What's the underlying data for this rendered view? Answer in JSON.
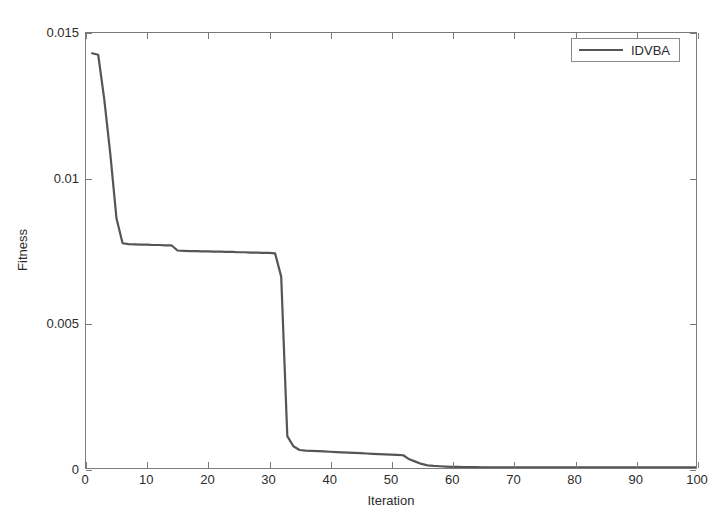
{
  "figure": {
    "background": "#ffffff",
    "axes_color": "#7a7a7a",
    "text_color": "#2b2b2b"
  },
  "axis": {
    "xlabel": "Iteration",
    "ylabel": "Fitness",
    "xticks": [
      "0",
      "10",
      "20",
      "30",
      "40",
      "50",
      "60",
      "70",
      "80",
      "90",
      "100"
    ],
    "yticks": [
      "0",
      "0.005",
      "0.01",
      "0.015"
    ]
  },
  "legend": {
    "entries": [
      {
        "label": "IDVBA",
        "color": "#555555"
      }
    ]
  },
  "chart_data": {
    "type": "line",
    "title": "",
    "xlabel": "Iteration",
    "ylabel": "Fitness",
    "xlim": [
      0,
      100
    ],
    "ylim": [
      0,
      0.015
    ],
    "xticks": [
      0,
      10,
      20,
      30,
      40,
      50,
      60,
      70,
      80,
      90,
      100
    ],
    "yticks": [
      0,
      0.005,
      0.01,
      0.015
    ],
    "grid": false,
    "legend_position": "top-right",
    "series": [
      {
        "name": "IDVBA",
        "color": "#555555",
        "line_width": 2,
        "x": [
          1,
          2,
          3,
          4,
          5,
          6,
          7,
          8,
          9,
          10,
          11,
          12,
          13,
          14,
          15,
          16,
          17,
          18,
          19,
          20,
          21,
          22,
          23,
          24,
          25,
          26,
          27,
          28,
          29,
          30,
          31,
          32,
          33,
          34,
          35,
          36,
          37,
          38,
          39,
          40,
          41,
          42,
          43,
          44,
          45,
          46,
          47,
          48,
          49,
          50,
          51,
          52,
          53,
          54,
          55,
          56,
          57,
          58,
          59,
          60,
          61,
          62,
          63,
          64,
          65,
          66,
          67,
          68,
          69,
          70,
          71,
          72,
          73,
          74,
          75,
          76,
          77,
          78,
          79,
          80,
          81,
          82,
          83,
          84,
          85,
          86,
          87,
          88,
          89,
          90,
          91,
          92,
          93,
          94,
          95,
          96,
          97,
          98,
          99,
          100
        ],
        "y": [
          0.0143,
          0.01425,
          0.0127,
          0.0108,
          0.0086,
          0.00775,
          0.00772,
          0.00771,
          0.0077,
          0.0077,
          0.00769,
          0.00769,
          0.00768,
          0.00768,
          0.0075,
          0.00749,
          0.00748,
          0.00748,
          0.00747,
          0.00747,
          0.00746,
          0.00746,
          0.00745,
          0.00745,
          0.00744,
          0.00744,
          0.00743,
          0.00743,
          0.00742,
          0.00742,
          0.0074,
          0.0066,
          0.0011,
          0.00075,
          0.00062,
          0.0006,
          0.00059,
          0.00058,
          0.00057,
          0.00056,
          0.00055,
          0.00054,
          0.00053,
          0.00052,
          0.00051,
          0.0005,
          0.00049,
          0.00048,
          0.00047,
          0.00046,
          0.00045,
          0.00044,
          0.0003,
          0.00022,
          0.00014,
          9e-05,
          7e-05,
          6e-05,
          5e-05,
          4e-05,
          4e-05,
          3e-05,
          3e-05,
          3e-05,
          2e-05,
          2e-05,
          2e-05,
          2e-05,
          2e-05,
          2e-05,
          2e-05,
          2e-05,
          2e-05,
          2e-05,
          2e-05,
          2e-05,
          2e-05,
          2e-05,
          2e-05,
          2e-05,
          2e-05,
          2e-05,
          2e-05,
          2e-05,
          2e-05,
          2e-05,
          2e-05,
          2e-05,
          2e-05,
          2e-05,
          2e-05,
          2e-05,
          2e-05,
          2e-05,
          2e-05,
          2e-05,
          2e-05,
          2e-05,
          2e-05,
          2e-05
        ]
      }
    ]
  }
}
